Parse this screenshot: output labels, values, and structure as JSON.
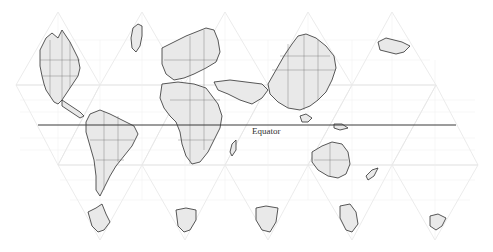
{
  "map": {
    "projection_style": "interrupted-polyhedral-lobes",
    "labels": {
      "equator": "Equator"
    },
    "colors": {
      "land_fill": "#e9e9e9",
      "coastline": "#2e2e2e",
      "graticule": "#eeeeee",
      "equator_line": "#3a3a3a",
      "background": "#ffffff"
    },
    "regions": [
      {
        "name": "North America"
      },
      {
        "name": "Greenland"
      },
      {
        "name": "Europe"
      },
      {
        "name": "Africa"
      },
      {
        "name": "Asia"
      },
      {
        "name": "South America"
      },
      {
        "name": "Australia"
      },
      {
        "name": "Antarctica"
      }
    ]
  }
}
